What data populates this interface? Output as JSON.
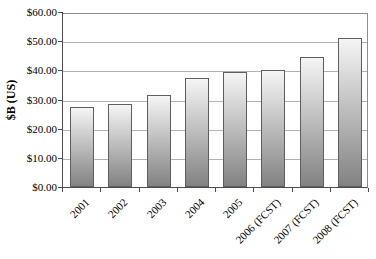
{
  "chart": {
    "background": "#ffffff",
    "plot_border_color": "#8c8c8c",
    "axis_color": "#4d4d4d",
    "gridline_color": "#b3b3b3",
    "bar_border_color": "#5e5e5e",
    "bar_gradient_top": "#f5f5f5",
    "bar_gradient_bottom": "#828282",
    "text_color": "#000000"
  },
  "chart_data": {
    "type": "bar",
    "title": "",
    "xlabel": "",
    "ylabel": "$B (US)",
    "categories": [
      "2001",
      "2002",
      "2003",
      "2004",
      "2005",
      "2006 (FCST)",
      "2007 (FCST)",
      "2008 (FCST)"
    ],
    "values": [
      27.5,
      28.5,
      31.5,
      37.5,
      39.5,
      40,
      44.5,
      51
    ],
    "ylim": [
      0,
      60
    ],
    "ytick_step": 10,
    "ytick_labels": [
      "$0.00",
      "$10.00",
      "$20.00",
      "$30.00",
      "$40.00",
      "$50.00",
      "$60.00"
    ],
    "grid": true,
    "legend": false,
    "series_fill": "vertical gradient, light top to dark gray bottom"
  }
}
